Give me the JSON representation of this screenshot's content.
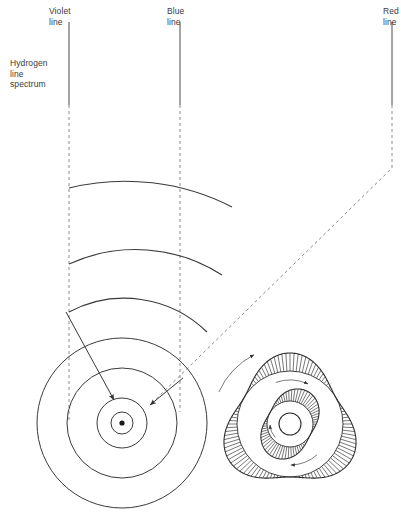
{
  "figure": {
    "background_color": "#ffffff",
    "stroke_color": "#333333",
    "dash_color": "#8a8a8a"
  },
  "labels": {
    "violet_line": "Violet\nline",
    "blue_line": "Blue\nline",
    "red_line": "Red\nline",
    "spectrum": "Hydrogen\nline\nspectrum"
  },
  "spectral_lines": [
    {
      "name": "violet-line",
      "label": "Violet line",
      "x": 69,
      "solid_top": 22,
      "solid_bottom": 105,
      "dash_bottom": 420
    },
    {
      "name": "blue-line",
      "label": "Blue line",
      "x": 180,
      "solid_top": 22,
      "solid_bottom": 105,
      "dash_bottom": 412
    },
    {
      "name": "red-line",
      "label": "Red line",
      "x": 392,
      "solid_top": 22,
      "solid_bottom": 105,
      "dash_bottom": 168,
      "diagonal_to_x": 150,
      "diagonal_to_y": 405
    }
  ],
  "wavefronts": {
    "count": 3,
    "center_x": 122,
    "center_y": 423,
    "radii": [
      235,
      160,
      118
    ],
    "description": "emitted light wavefront arcs"
  },
  "bohr_atom": {
    "name": "bohr-atom",
    "center_x": 122,
    "center_y": 423,
    "orbit_radii": [
      11,
      25,
      55,
      85
    ],
    "nucleus_radius": 2.6,
    "transitions": [
      {
        "name": "violet-transition",
        "from_x": 66,
        "from_y": 312,
        "to_x": 114,
        "to_y": 400
      },
      {
        "name": "red-transition",
        "from_x": 183,
        "from_y": 378,
        "to_x": 150,
        "to_y": 405
      }
    ]
  },
  "standing_wave": {
    "name": "de-broglie-standing-wave",
    "center_x": 290,
    "center_y": 424,
    "outer": {
      "lobes": 3,
      "base_radius": 62,
      "amplitude": 9,
      "hatch_count": 108
    },
    "inner": {
      "lobes": 2,
      "base_radius": 30,
      "amplitude": 7,
      "hatch_count": 70
    },
    "core_radius": 11,
    "arrow_count": 4
  }
}
